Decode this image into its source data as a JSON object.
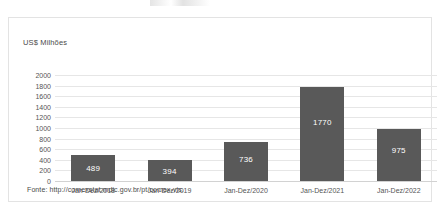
{
  "chart_data": {
    "type": "bar",
    "title": "",
    "subtitle": "",
    "xlabel": "",
    "ylabel": "US$ Milhões",
    "categories": [
      "Jan-Dez/2018",
      "Jan-Dez/2019",
      "Jan-Dez/2020",
      "Jan-Dez/2021",
      "Jan-Dez/2022"
    ],
    "values": [
      489,
      394,
      736,
      1770,
      975
    ],
    "data_labels": [
      "489",
      "394",
      "736",
      "1770",
      "975"
    ],
    "ylim": [
      0,
      2000
    ],
    "yticks": [
      0,
      200,
      400,
      600,
      800,
      1000,
      1200,
      1400,
      1600,
      1800,
      2000
    ],
    "ytick_labels": [
      "0",
      "200",
      "400",
      "600",
      "800",
      "1000",
      "1200",
      "1400",
      "1600",
      "1800",
      "2000"
    ],
    "grid": true,
    "grid_axis": "y",
    "legend": false,
    "bar_color": "#595959",
    "data_label_color": "#ffffff",
    "gridline_color": "#e6e6e6",
    "frame_color": "#e3e3e3"
  },
  "footnote": {
    "source_text": "Fonte: http://comexstat.mdic.gov.br/pt/comex-vis."
  }
}
